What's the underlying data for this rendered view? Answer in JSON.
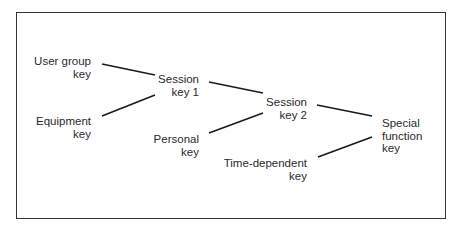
{
  "diagram": {
    "nodes": [
      {
        "id": "user_group_key",
        "lines": [
          "User group",
          "key"
        ]
      },
      {
        "id": "equipment_key",
        "lines": [
          "Equipment",
          "key"
        ]
      },
      {
        "id": "session_key_1",
        "lines": [
          "Session",
          "key 1"
        ]
      },
      {
        "id": "personal_key",
        "lines": [
          "Personal",
          "key"
        ]
      },
      {
        "id": "session_key_2",
        "lines": [
          "Session",
          "key 2"
        ]
      },
      {
        "id": "time_dependent_key",
        "lines": [
          "Time-dependent",
          "key"
        ]
      },
      {
        "id": "special_function_key",
        "lines": [
          "Special",
          "function",
          "key"
        ]
      }
    ],
    "edges": [
      {
        "from": "user_group_key",
        "to": "session_key_1"
      },
      {
        "from": "equipment_key",
        "to": "session_key_1"
      },
      {
        "from": "session_key_1",
        "to": "session_key_2"
      },
      {
        "from": "personal_key",
        "to": "session_key_2"
      },
      {
        "from": "session_key_2",
        "to": "special_function_key"
      },
      {
        "from": "time_dependent_key",
        "to": "special_function_key"
      }
    ],
    "line_color": "#1a1a1a",
    "frame_color": "#333333"
  }
}
